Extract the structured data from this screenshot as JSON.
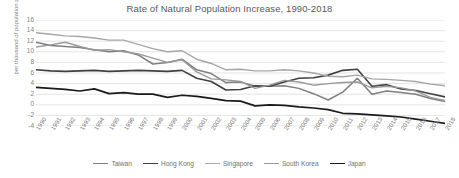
{
  "chart_data": {
    "type": "line",
    "title": "Rate of Natural Population Increase, 1990-2018",
    "xlabel": "",
    "ylabel": "per thousand of population per year",
    "ylim": [
      -4,
      16
    ],
    "yticks": [
      16,
      14,
      12,
      10,
      8,
      6,
      4,
      2,
      0,
      -2,
      -4
    ],
    "grid": true,
    "legend_position": "bottom",
    "x": [
      "1990",
      "1991",
      "1992",
      "1993",
      "1994",
      "1995",
      "1996",
      "1997",
      "1998",
      "1999",
      "2000",
      "2001",
      "2002",
      "2003",
      "2004",
      "2005",
      "2006",
      "2007",
      "2008",
      "2009",
      "2010",
      "2011",
      "2012",
      "2013",
      "2014",
      "2015",
      "2016",
      "2017",
      "2018"
    ],
    "series": [
      {
        "name": "Taiwan",
        "color": "#7f7f7f",
        "width": 1.5,
        "values": [
          11.8,
          11.2,
          11.0,
          10.8,
          10.4,
          10.0,
          10.2,
          9.4,
          7.7,
          8.0,
          8.6,
          6.6,
          5.9,
          4.2,
          4.3,
          3.5,
          3.5,
          3.6,
          3.1,
          2.1,
          0.9,
          2.4,
          5.0,
          2.0,
          2.6,
          2.3,
          2.0,
          1.2,
          0.6
        ]
      },
      {
        "name": "Hong Kong",
        "color": "#404040",
        "width": 1.6,
        "values": [
          6.6,
          6.4,
          6.3,
          6.4,
          6.5,
          6.3,
          6.4,
          6.5,
          6.4,
          6.3,
          6.5,
          5.0,
          4.4,
          2.8,
          2.9,
          3.6,
          3.5,
          4.3,
          5.0,
          5.1,
          5.6,
          6.5,
          6.7,
          3.5,
          3.8,
          3.0,
          2.7,
          2.1,
          1.5
        ]
      },
      {
        "name": "Singapore",
        "color": "#a6a6a6",
        "width": 1.4,
        "values": [
          13.6,
          13.3,
          13.0,
          12.9,
          12.6,
          12.2,
          12.2,
          11.4,
          10.6,
          10.0,
          10.2,
          8.6,
          7.8,
          6.6,
          6.7,
          6.4,
          6.4,
          6.6,
          6.4,
          6.0,
          5.4,
          5.3,
          5.6,
          4.9,
          4.8,
          4.6,
          4.4,
          3.9,
          3.6
        ]
      },
      {
        "name": "South Korea",
        "color": "#999999",
        "width": 1.4,
        "values": [
          10.9,
          11.3,
          11.8,
          11.0,
          10.3,
          10.4,
          10.0,
          9.6,
          8.8,
          8.0,
          8.5,
          6.2,
          4.9,
          4.7,
          4.4,
          3.1,
          3.7,
          4.6,
          4.3,
          3.7,
          4.0,
          4.2,
          4.3,
          3.2,
          3.5,
          3.2,
          2.6,
          1.4,
          0.8
        ]
      },
      {
        "name": "Japan",
        "color": "#1a1a1a",
        "width": 1.7,
        "values": [
          3.3,
          3.1,
          2.9,
          2.6,
          3.0,
          2.1,
          2.3,
          2.0,
          2.0,
          1.4,
          1.8,
          1.6,
          1.2,
          0.8,
          0.7,
          -0.2,
          0.0,
          -0.1,
          -0.4,
          -0.6,
          -0.9,
          -1.6,
          -1.7,
          -1.9,
          -2.1,
          -2.3,
          -2.7,
          -3.1,
          -3.5
        ]
      }
    ]
  },
  "styling": {
    "grid_color": "#d9d9d9",
    "axis_text_color": "#808080",
    "title_color": "#595959",
    "background": "#ffffff"
  }
}
